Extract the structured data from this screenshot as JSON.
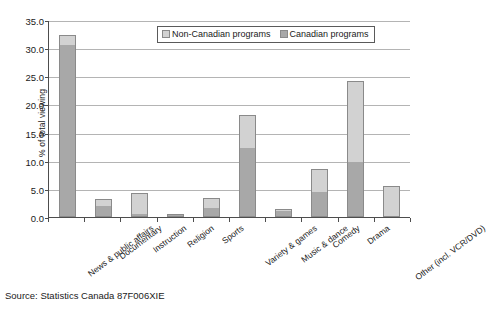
{
  "chart_data": {
    "type": "bar",
    "stacked": true,
    "title": "",
    "xlabel": "",
    "ylabel": "% of total viewing",
    "ylim": [
      0,
      35
    ],
    "ytick_step": 5,
    "ytick_labels": [
      "0.0",
      "5.0",
      "10.0",
      "15.0",
      "20.0",
      "25.0",
      "30.0",
      "35.0"
    ],
    "grid": true,
    "legend_position": "top-center",
    "categories": [
      "News & public affairs",
      "Documentary",
      "Instruction",
      "Religion",
      "Sports",
      "Variety & games",
      "Music & dance",
      "Comedy",
      "Drama",
      "Other (incl. VCR/DVD)"
    ],
    "series": [
      {
        "name": "Canadian programs",
        "color": "#a8a8a8",
        "values": [
          30.5,
          2.0,
          0.6,
          0.3,
          1.6,
          12.3,
          1.1,
          4.5,
          9.8,
          0.0
        ]
      },
      {
        "name": "Non-Canadian programs",
        "color": "#d2d2d2",
        "values": [
          1.8,
          1.2,
          3.6,
          0.1,
          1.7,
          5.8,
          0.4,
          4.0,
          14.3,
          5.5
        ]
      }
    ],
    "totals": [
      32.3,
      3.2,
      4.2,
      0.4,
      3.3,
      18.1,
      1.5,
      8.5,
      24.1,
      5.5
    ]
  },
  "legend": {
    "entries": [
      {
        "label": "Non-Canadian programs",
        "swatch": "legend-swatch-noncanadian"
      },
      {
        "label": "Canadian programs",
        "swatch": "legend-swatch-canadian"
      }
    ]
  },
  "source": {
    "text": "Source: Statistics Canada 87F006XIE"
  }
}
